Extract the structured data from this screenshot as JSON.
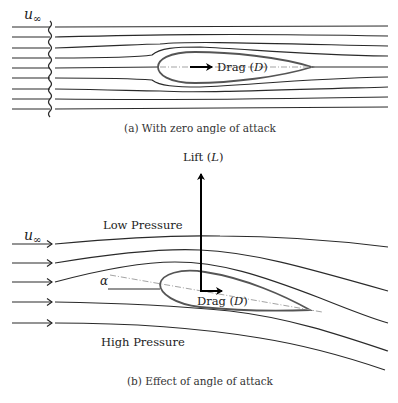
{
  "figure_a": {
    "freestream_label": "u",
    "freestream_sub": "∞",
    "drag_label": "Drag (",
    "drag_symbol": "D",
    "drag_close": ")",
    "caption": "(a) With zero angle of attack"
  },
  "figure_b": {
    "freestream_label": "u",
    "freestream_sub": "∞",
    "lift_label": "Lift (",
    "lift_symbol": "L",
    "lift_close": ")",
    "drag_label": "Drag (",
    "drag_symbol": "D",
    "drag_close": ")",
    "low_pressure_label": "Low Pressure",
    "high_pressure_label": "High Pressure",
    "angle_symbol": "α",
    "caption": "(b) Effect of angle of attack"
  },
  "colors": {
    "streamline": "#2a2a2a",
    "airfoil": "#555555",
    "chord": "#999999",
    "force": "#000000"
  }
}
